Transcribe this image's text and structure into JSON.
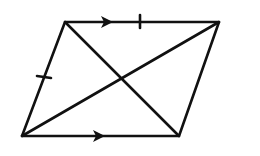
{
  "figure": {
    "type": "parallelogram-with-diagonals",
    "stroke_color": "#111111",
    "background": "#ffffff",
    "vertices": {
      "top_left": [
        65,
        22
      ],
      "top_right": [
        219,
        22
      ],
      "bottom_right": [
        179,
        136
      ],
      "bottom_left": [
        22,
        136
      ]
    },
    "markings": {
      "parallel_arrows": [
        "top-side",
        "bottom-side"
      ],
      "congruence_ticks": [
        "top-side",
        "left-side"
      ]
    }
  }
}
